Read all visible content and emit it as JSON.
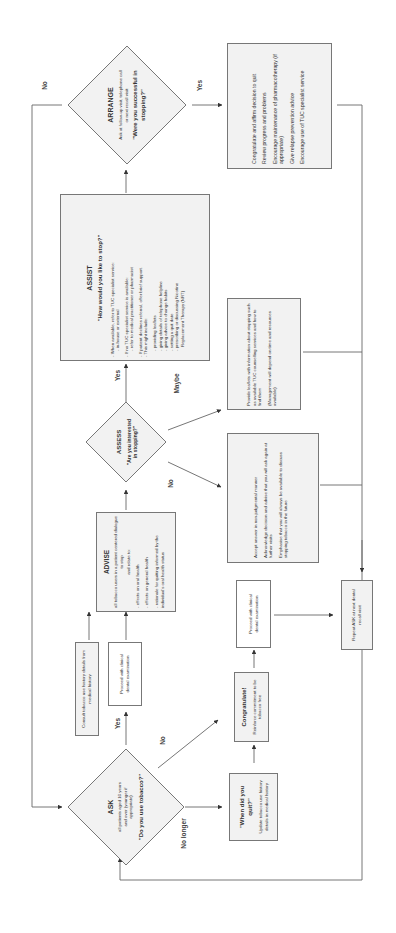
{
  "flowchart": {
    "orientation": "rotated-90-ccw",
    "colors": {
      "box_fill": "#f2f2f2",
      "border": "#777777",
      "line": "#666666",
      "text": "#333333"
    },
    "arrange": {
      "title": "ARRANGE",
      "subtitle": "Ask at follow-up visit, telephone call or next recall visit:",
      "question": "\"Were you successful in stopping?\""
    },
    "success_box": {
      "items": [
        "Congratulate and affirm decision to quit",
        "Review progress and problems",
        "Encourage maintenance of pharmacotherapy (if appropriate)",
        "Give relapse prevention advice",
        "Encourage use of TUC specialist service"
      ]
    },
    "assist": {
      "title": "ASSIST",
      "question": "\"How would you like to stop?\"",
      "lines": [
        "- When available, refer to TUC specialist service:",
        "  - in-house or external",
        "- If no TUC specialist service is available:",
        "  - refer to medical practitioner or pharmacist",
        "- If patient declines referral, offer brief support.",
        "- This might include:",
        "  - providing leaflets",
        "  - giving details of telephone helpline",
        "  - giving advice to change habits",
        "  - setting a quit date",
        "  - prescribing or discussing Nicotine",
        "    Replacement Therapy (NRT)"
      ]
    },
    "assess": {
      "title": "ASSESS",
      "question": "\"Are you interested in stopping?\""
    },
    "maybe_box": {
      "items": [
        "Provide leaflets with information about stopping such as available TUC counselling services and how to find them",
        "(Management will depend on time and resources available)"
      ]
    },
    "no_box": {
      "items": [
        "Accept answer in non-judgmental manner",
        "Acknowledge decision and advise that you will ask again at further visits",
        "Emphasise that you will always be available to discuss stopping tobacco in the future"
      ]
    },
    "advise": {
      "title": "ADVISE",
      "intro": "all tobacco users in a patient centered dialogue to stop",
      "relate": "and relate to:",
      "lines": [
        "- effects on oral health",
        "- effects on general health",
        "- rationale for quitting informed by the individual's oral health status"
      ]
    },
    "consult_box": {
      "text": "Consult tobacco use history details from medical history"
    },
    "proceed_box_1": {
      "text": "Proceed with clinical dental examination"
    },
    "ask": {
      "title": "ASK",
      "subtitle": "all patients aged 16 years and over (younger if appropriate)",
      "question": "\"Do you use tobacco?\""
    },
    "congratulate_box": {
      "title": "Congratulate!",
      "text": "Reinforce commitment to be tobacco free"
    },
    "proceed_box_2": {
      "text": "Proceed with clinical dental examination"
    },
    "repeat_box": {
      "text": "Repeat ASK at next dental recall visit"
    },
    "quit_box": {
      "question": "\"When did you quit?\"",
      "text": "Update tobacco use history details in medical history"
    },
    "edge_labels": {
      "arrange_no": "No",
      "arrange_yes": "Yes",
      "assess_yes": "Yes",
      "assess_maybe": "Maybe",
      "assess_no": "No",
      "ask_yes": "Yes",
      "ask_no": "No",
      "ask_no_longer": "No longer"
    }
  }
}
